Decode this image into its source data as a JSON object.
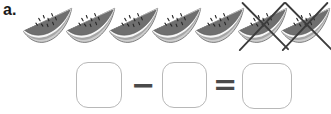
{
  "problem": {
    "label": "a.",
    "objects": {
      "icon": "watermelon-slice",
      "total": 7,
      "crossed_out": 2,
      "remaining": 5
    },
    "equation": {
      "minuend_value": "",
      "minus_sign": "−",
      "subtrahend_value": "",
      "equals_sign": "=",
      "result_value": ""
    }
  },
  "layout_counts": {
    "slice_start_left_px": 22,
    "slice_spacing_px": 43
  },
  "colors": {
    "page": "#ffffff",
    "flesh": "#6f6f6f",
    "seed": "#262626",
    "inner_rind": "#f8f8f8",
    "mid_rind": "#a6a6a6",
    "outer_rind": "#cecece",
    "outline": "#585858",
    "cross": "#3c3c3c",
    "box_border": "#b8b8b8",
    "operator": "#4a4a4a",
    "label": "#1a1a1a"
  }
}
